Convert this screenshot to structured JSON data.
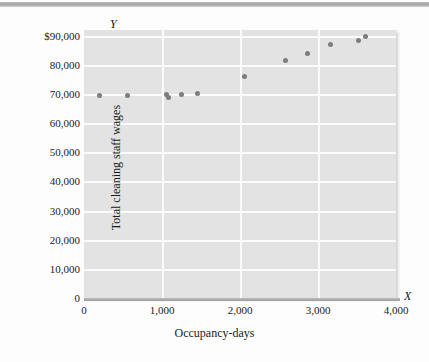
{
  "figure": {
    "y_axis_symbol": "Y",
    "x_axis_symbol": "X",
    "x_axis_title": "Occupancy-days",
    "y_axis_title": "Total cleaning staff wages",
    "point_color": "#7d7d7d",
    "panel_color": "#e3e3e3",
    "gridline_color": "#fbfbfb"
  },
  "chart_data": {
    "type": "scatter",
    "title": "",
    "xlabel": "Occupancy-days",
    "ylabel": "Total cleaning staff wages",
    "xlim": [
      0,
      4000
    ],
    "ylim": [
      0,
      92000
    ],
    "grid": true,
    "legend": null,
    "xticks": [
      0,
      1000,
      2000,
      3000,
      4000
    ],
    "xticklabels": [
      "0",
      "1,000",
      "2,000",
      "3,000",
      "4,000"
    ],
    "yticks": [
      0,
      10000,
      20000,
      30000,
      40000,
      50000,
      60000,
      70000,
      80000,
      90000
    ],
    "yticklabels": [
      "0",
      "10,000",
      "20,000",
      "30,000",
      "40,000",
      "50,000",
      "60,000",
      "70,000",
      "80,000",
      "$90,000"
    ],
    "x": [
      200,
      560,
      1055,
      1085,
      1250,
      1450,
      2060,
      2580,
      2860,
      3160,
      3520,
      3610
    ],
    "y": [
      69500,
      69500,
      69900,
      68900,
      70000,
      70100,
      76200,
      81500,
      84000,
      87100,
      88500,
      89800
    ],
    "points": [
      {
        "x": 200,
        "y": 69500
      },
      {
        "x": 560,
        "y": 69500
      },
      {
        "x": 1055,
        "y": 69900
      },
      {
        "x": 1085,
        "y": 68900
      },
      {
        "x": 1250,
        "y": 70000
      },
      {
        "x": 1450,
        "y": 70100
      },
      {
        "x": 2060,
        "y": 76200
      },
      {
        "x": 2580,
        "y": 81500
      },
      {
        "x": 2860,
        "y": 84000
      },
      {
        "x": 3160,
        "y": 87100
      },
      {
        "x": 3520,
        "y": 88500
      },
      {
        "x": 3610,
        "y": 89800
      }
    ]
  }
}
